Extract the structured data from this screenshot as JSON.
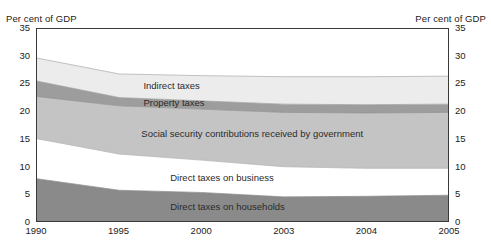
{
  "axes": {
    "left_unit_label": "Per cent of GDP",
    "right_unit_label": "Per cent of GDP",
    "y_ticks": [
      "35",
      "30",
      "25",
      "20",
      "15",
      "10",
      "5",
      "0"
    ],
    "x_ticks": [
      "1990",
      "1995",
      "2000",
      "2003",
      "2004",
      "2005"
    ]
  },
  "band_labels": {
    "indirect": "Indirect taxes",
    "property": "Property taxes",
    "social": "Social security contributions received by government",
    "business": "Direct taxes on business",
    "households": "Direct taxes on households"
  },
  "colors": {
    "indirect": "#ececec",
    "property": "#9d9d9d",
    "social": "#c4c4c4",
    "business": "#ffffff",
    "households": "#8a8a8a",
    "axis": "#3a3a3a",
    "text": "#222222"
  },
  "chart_data": {
    "type": "area",
    "title": "",
    "subtitle": "",
    "xlabel": "",
    "ylabel": "Per cent of GDP",
    "ylim": [
      0,
      35
    ],
    "yticks": [
      0,
      5,
      10,
      15,
      20,
      25,
      30,
      35
    ],
    "grid": false,
    "legend": "inline-band-labels",
    "stacked": true,
    "stack_order_bottom_to_top": [
      "Direct taxes on households",
      "Direct taxes on business",
      "Social security contributions received by government",
      "Property taxes",
      "Indirect taxes"
    ],
    "x": [
      "1990",
      "1995",
      "2000",
      "2003",
      "2004",
      "2005"
    ],
    "x_positions_fraction": [
      0.0,
      0.2,
      0.4,
      0.6,
      0.8,
      1.0
    ],
    "series": [
      {
        "name": "Direct taxes on households",
        "color": "#8a8a8a",
        "values": [
          7.7,
          5.6,
          5.2,
          4.4,
          4.5,
          4.7
        ]
      },
      {
        "name": "Direct taxes on business",
        "color": "#ffffff",
        "values": [
          2.2,
          2.3,
          2.5,
          3.2,
          3.8,
          4.3
        ]
      },
      {
        "name": "Social security contributions received by government",
        "color": "#c4c4c4",
        "values": [
          5.1,
          4.3,
          4.2,
          4.0,
          4.0,
          4.0
        ]
      },
      {
        "name": "Property taxes",
        "color": "#9d9d9d",
        "values": [
          2.8,
          1.5,
          1.5,
          1.5,
          1.5,
          1.5
        ]
      },
      {
        "name": "Indirect taxes",
        "color": "#ececec",
        "values": [
          4.2,
          4.3,
          4.6,
          5.0,
          5.1,
          5.1
        ]
      }
    ],
    "cumulative_boundaries": {
      "households_top": [
        7.7,
        5.6,
        5.2,
        4.4,
        4.5,
        4.7
      ],
      "business_top": [
        9.9,
        7.9,
        7.7,
        7.6,
        8.3,
        9.0
      ],
      "social_top": [
        15.0,
        12.2,
        11.9,
        11.6,
        12.3,
        13.0
      ],
      "property_top": [
        17.8,
        13.7,
        13.4,
        13.1,
        13.8,
        14.5
      ],
      "indirect_top": [
        22.0,
        18.0,
        18.0,
        18.1,
        18.9,
        19.6
      ]
    },
    "plotted_boundaries_from_top": {
      "total_top": [
        29.7,
        26.8,
        26.5,
        26.3,
        26.3,
        26.4
      ],
      "property_upper": [
        25.5,
        22.5,
        21.9,
        21.3,
        21.2,
        21.3
      ],
      "property_lower": [
        22.7,
        21.0,
        20.4,
        19.8,
        19.7,
        19.8
      ],
      "social_lower": [
        15.0,
        12.2,
        11.1,
        9.9,
        9.6,
        9.6
      ],
      "households_top": [
        7.7,
        5.6,
        5.2,
        4.4,
        4.5,
        4.7
      ]
    }
  }
}
